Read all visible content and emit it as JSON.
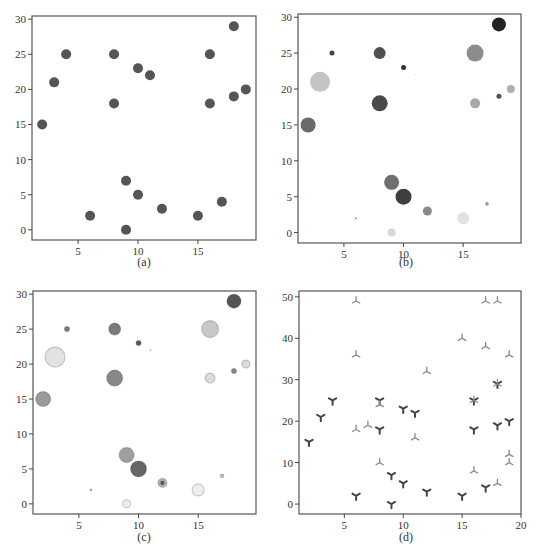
{
  "chart_data": [
    {
      "id": "a",
      "type": "scatter",
      "caption": "(a)",
      "title": "",
      "xlabel": "",
      "ylabel": "",
      "xlim": [
        1.15,
        19.85
      ],
      "ylim": [
        -1.45,
        30.45
      ],
      "xticks": [
        5,
        10,
        15
      ],
      "yticks": [
        0,
        5,
        10,
        15,
        20,
        25,
        30
      ],
      "grid": false,
      "series": [
        {
          "name": "points",
          "marker": "circle",
          "color": "#555555",
          "x": [
            2,
            3,
            4,
            6,
            8,
            8,
            9,
            9,
            10,
            10,
            11,
            12,
            15,
            16,
            16,
            17,
            18,
            18,
            19
          ],
          "y": [
            15,
            21,
            25,
            2,
            25,
            18,
            7,
            0,
            23,
            5,
            22,
            3,
            2,
            25,
            18,
            4,
            29,
            19,
            20
          ],
          "sizes": [
            5,
            5,
            5,
            5,
            5,
            5,
            5,
            5,
            5,
            5,
            5,
            5,
            5,
            5,
            5,
            5,
            5,
            5,
            5
          ]
        }
      ]
    },
    {
      "id": "b",
      "type": "scatter",
      "caption": "(b)",
      "title": "",
      "xlabel": "",
      "ylabel": "",
      "xlim": [
        1.15,
        19.85
      ],
      "ylim": [
        -1.45,
        30.45
      ],
      "xticks": [
        5,
        10,
        15
      ],
      "yticks": [
        0,
        5,
        10,
        15,
        20,
        25,
        30
      ],
      "grid": false,
      "series": [
        {
          "name": "points-varied-size-gray",
          "marker": "circle",
          "x": [
            2,
            3,
            4,
            6,
            8,
            8,
            9,
            9,
            10,
            10,
            11,
            12,
            15,
            16,
            16,
            17,
            18,
            18,
            19
          ],
          "y": [
            15,
            21,
            25,
            2,
            25,
            18,
            7,
            0,
            23,
            5,
            22,
            3,
            2,
            25,
            18,
            4,
            29,
            19,
            20
          ],
          "sizes": [
            7.5,
            10,
            2.5,
            0.8,
            6,
            8,
            7.5,
            4,
            2.5,
            8,
            0.6,
            4.5,
            6,
            8.5,
            5,
            1.8,
            7,
            2.5,
            4
          ],
          "colors": [
            "#6a6a6a",
            "#c4c4c4",
            "#444444",
            "#555555",
            "#505050",
            "#4a4a4a",
            "#6f6f6f",
            "#d8d8d8",
            "#333333",
            "#3e3e3e",
            "#e0e0e0",
            "#8a8a8a",
            "#e2e2e2",
            "#8c8c8c",
            "#a8a8a8",
            "#999999",
            "#222222",
            "#505050",
            "#b0b0b0"
          ]
        }
      ]
    },
    {
      "id": "c",
      "type": "scatter",
      "caption": "(c)",
      "title": "",
      "xlabel": "",
      "ylabel": "",
      "xlim": [
        1.15,
        19.85
      ],
      "ylim": [
        -1.45,
        30.45
      ],
      "xticks": [
        5,
        10,
        15
      ],
      "yticks": [
        0,
        5,
        10,
        15,
        20,
        25,
        30
      ],
      "grid": false,
      "series": [
        {
          "name": "points-varied-size-gray-edged",
          "marker": "circle",
          "x": [
            2,
            3,
            4,
            6,
            8,
            8,
            9,
            9,
            10,
            10,
            11,
            12,
            15,
            16,
            16,
            17,
            18,
            18,
            19
          ],
          "y": [
            15,
            21,
            25,
            2,
            25,
            18,
            7,
            0,
            23,
            5,
            22,
            3,
            2,
            25,
            18,
            4,
            29,
            19,
            20
          ],
          "sizes": [
            7.5,
            10,
            2.5,
            0.8,
            6,
            8,
            7.5,
            4,
            2.5,
            8,
            0.6,
            4.5,
            6,
            8.5,
            5,
            1.8,
            7,
            2.5,
            4
          ],
          "colors": [
            "#9a9a9a",
            "#e2e2e2",
            "#7a7a7a",
            "#909090",
            "#7a7a7a",
            "#888888",
            "#a0a0a0",
            "#ececec",
            "#5a5a5a",
            "#666666",
            "#f0f0f0",
            "#b0b0b0",
            "#eeeeee",
            "#c8c8c8",
            "#dcdcdc",
            "#c0c0c0",
            "#555555",
            "#8a8a8a",
            "#dcdcdc"
          ],
          "inner": [
            false,
            false,
            false,
            false,
            false,
            false,
            false,
            false,
            false,
            false,
            false,
            true,
            false,
            false,
            false,
            false,
            false,
            false,
            false
          ]
        }
      ]
    },
    {
      "id": "d",
      "type": "scatter",
      "caption": "(d)",
      "title": "",
      "xlabel": "",
      "ylabel": "",
      "xlim": [
        1.15,
        20
      ],
      "ylim": [
        -2.4,
        51.4
      ],
      "xticks": [
        5,
        10,
        15,
        20
      ],
      "yticks": [
        0,
        10,
        20,
        30,
        40,
        50
      ],
      "grid": false,
      "series": [
        {
          "name": "series-1",
          "marker": "tri_down",
          "color": "#444444",
          "x": [
            2,
            3,
            4,
            6,
            8,
            8,
            9,
            9,
            10,
            10,
            11,
            12,
            15,
            16,
            16,
            17,
            18,
            18,
            19
          ],
          "y": [
            15,
            21,
            25,
            2,
            25,
            18,
            7,
            0,
            23,
            5,
            22,
            3,
            2,
            25,
            18,
            4,
            29,
            19,
            20
          ]
        },
        {
          "name": "series-2",
          "marker": "tri_up",
          "color": "#8a8a8a",
          "x": [
            6,
            6,
            6,
            7,
            8,
            8,
            11,
            12,
            15,
            16,
            16,
            17,
            17,
            18,
            18,
            18,
            19,
            19,
            19
          ],
          "y": [
            49,
            36,
            18,
            19,
            24,
            10,
            16,
            32,
            40,
            25,
            8,
            49,
            38,
            49,
            29,
            5,
            36,
            12,
            10
          ]
        }
      ]
    }
  ],
  "layout": {
    "panels": [
      {
        "id": "a",
        "box": [
          32,
          16,
          256,
          240
        ],
        "caption_pos": [
          144,
          262
        ]
      },
      {
        "id": "b",
        "box": [
          298,
          14,
          521,
          243
        ],
        "caption_pos": [
          406,
          262
        ]
      },
      {
        "id": "c",
        "box": [
          33,
          291,
          256,
          514
        ],
        "caption_pos": [
          144,
          537
        ]
      },
      {
        "id": "d",
        "box": [
          299,
          291,
          521,
          514
        ],
        "caption_pos": [
          406,
          537
        ]
      }
    ],
    "axis_color": "#555555",
    "tick_color": "#444444"
  }
}
